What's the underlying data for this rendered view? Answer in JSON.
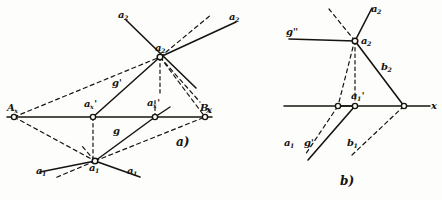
{
  "figure": {
    "kind": "descriptive-geometry-line-projection-diagram",
    "ink_color": "#16140f",
    "paper_color": "#fdfdfb",
    "captions": [
      {
        "id": "caption-a",
        "text": "a)",
        "x": 176,
        "y": 142
      },
      {
        "id": "caption-b",
        "text": "b)",
        "x": 340,
        "y": 181
      }
    ],
    "panel_a": {
      "name": "a",
      "ground_line_label": "x",
      "axis_label_right": {
        "text": "x",
        "x": 206,
        "y": 110
      },
      "points": [
        {
          "id": "Ax",
          "base": "A",
          "sub": "x",
          "prime": "",
          "px": 14,
          "py": 117,
          "lx": 7,
          "ly": 104
        },
        {
          "id": "Bx",
          "base": "B",
          "sub": "x",
          "prime": "",
          "px": 205,
          "py": 117,
          "lx": 203,
          "ly": 105
        },
        {
          "id": "axp",
          "base": "a",
          "sub": "x",
          "prime": "'",
          "px": 93,
          "py": 117,
          "lx": 84,
          "ly": 101
        },
        {
          "id": "axs",
          "base": "a",
          "sub": "x",
          "prime": "'",
          "px": 155,
          "py": 117,
          "lx": 148,
          "ly": 100
        },
        {
          "id": "a2",
          "base": "a",
          "sub": "2",
          "prime": "",
          "px": 160,
          "py": 57,
          "lx": 156,
          "ly": 44
        },
        {
          "id": "a1",
          "base": "a",
          "sub": "1",
          "prime": "",
          "px": 95,
          "py": 161,
          "lx": 90,
          "ly": 163
        }
      ],
      "ray_labels": [
        {
          "id": "ray-a2-upper-left",
          "text": "a",
          "sub": "2",
          "x": 118,
          "y": 12
        },
        {
          "id": "ray-a2-upper-right",
          "text": "a",
          "sub": "2",
          "x": 229,
          "y": 14
        },
        {
          "id": "ray-a1-lower-left",
          "text": "a",
          "sub": "1",
          "x": 36,
          "y": 168
        },
        {
          "id": "ray-a1-lower-right",
          "text": "a",
          "sub": "1",
          "x": 127,
          "y": 168
        }
      ],
      "line_labels": [
        {
          "id": "label-g-prime",
          "text": "g",
          "prime": "'",
          "x": 114,
          "y": 80
        },
        {
          "id": "label-g",
          "text": "g",
          "prime": "",
          "x": 114,
          "y": 128
        }
      ]
    },
    "panel_b": {
      "name": "b",
      "axis_label_right": {
        "text": "x",
        "x": 432,
        "y": 107
      },
      "points": [
        {
          "id": "b-a2",
          "base": "a",
          "sub": "2",
          "prime": "",
          "px": 355,
          "py": 41,
          "lx": 361,
          "ly": 36
        },
        {
          "id": "b-a1p",
          "base": "a",
          "sub": "1",
          "prime": "'",
          "px": 355,
          "py": 106,
          "lx": 352,
          "ly": 93
        },
        {
          "id": "b-j1",
          "base": "",
          "sub": "",
          "prime": "",
          "px": 338,
          "py": 106,
          "lx": 0,
          "ly": 0
        },
        {
          "id": "b-j2",
          "base": "",
          "sub": "",
          "prime": "",
          "px": 404,
          "py": 106,
          "lx": 0,
          "ly": 0
        }
      ],
      "line_labels": [
        {
          "id": "b-label-g-dprime",
          "text": "g",
          "prime": "''",
          "x": 288,
          "y": 29
        },
        {
          "id": "b-label-b2",
          "text": "b",
          "sub": "2",
          "x": 382,
          "y": 64
        },
        {
          "id": "b-label-a1",
          "text": "a",
          "sub": "1",
          "x": 285,
          "y": 140
        },
        {
          "id": "b-label-g-prime",
          "text": "g",
          "prime": "'",
          "x": 305,
          "y": 140
        },
        {
          "id": "b-label-b1",
          "text": "b",
          "sub": "1",
          "x": 348,
          "y": 140
        }
      ]
    }
  }
}
